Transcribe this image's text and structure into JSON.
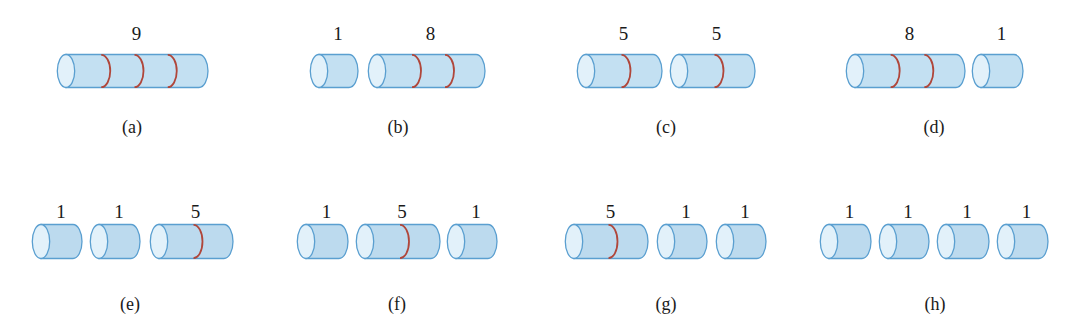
{
  "figure": {
    "colors": {
      "body_fill": "#c3e0f2",
      "body_fill_row2": "#bcdaee",
      "end_cap_fill": "#e2f1fa",
      "outline": "#5a9fd0",
      "cut_line": "#b0463a",
      "text": "#1a1a1a"
    },
    "panels": [
      {
        "id": "a",
        "caption": "(a)",
        "caption_x": 132,
        "row": 1,
        "cylinders": [
          {
            "label": "9",
            "x": 57,
            "w": 151,
            "cuts": 3
          }
        ]
      },
      {
        "id": "b",
        "caption": "(b)",
        "caption_x": 398,
        "row": 1,
        "cylinders": [
          {
            "label": "1",
            "x": 310,
            "w": 48,
            "cuts": 0
          },
          {
            "label": "8",
            "x": 368,
            "w": 117,
            "cuts": 2
          }
        ]
      },
      {
        "id": "c",
        "caption": "(c)",
        "caption_x": 666,
        "row": 1,
        "cylinders": [
          {
            "label": "5",
            "x": 577,
            "w": 85,
            "cuts": 1
          },
          {
            "label": "5",
            "x": 670,
            "w": 85,
            "cuts": 1
          }
        ]
      },
      {
        "id": "d",
        "caption": "(d)",
        "caption_x": 934,
        "row": 1,
        "cylinders": [
          {
            "label": "8",
            "x": 846,
            "w": 119,
            "cuts": 2
          },
          {
            "label": "1",
            "x": 972,
            "w": 51,
            "cuts": 0
          }
        ]
      },
      {
        "id": "e",
        "caption": "(e)",
        "caption_x": 130,
        "row": 2,
        "cylinders": [
          {
            "label": "1",
            "x": 32,
            "w": 50,
            "cuts": 0
          },
          {
            "label": "1",
            "x": 90,
            "w": 50,
            "cuts": 0
          },
          {
            "label": "5",
            "x": 150,
            "w": 83,
            "cuts": 1
          }
        ]
      },
      {
        "id": "f",
        "caption": "(f)",
        "caption_x": 397,
        "row": 2,
        "cylinders": [
          {
            "label": "1",
            "x": 297,
            "w": 51,
            "cuts": 0
          },
          {
            "label": "5",
            "x": 356,
            "w": 84,
            "cuts": 1
          },
          {
            "label": "1",
            "x": 447,
            "w": 50,
            "cuts": 0
          }
        ]
      },
      {
        "id": "g",
        "caption": "(g)",
        "caption_x": 666,
        "row": 2,
        "cylinders": [
          {
            "label": "5",
            "x": 565,
            "w": 83,
            "cuts": 1
          },
          {
            "label": "1",
            "x": 657,
            "w": 50,
            "cuts": 0
          },
          {
            "label": "1",
            "x": 716,
            "w": 50,
            "cuts": 0
          }
        ]
      },
      {
        "id": "h",
        "caption": "(h)",
        "caption_x": 935,
        "row": 2,
        "cylinders": [
          {
            "label": "1",
            "x": 820,
            "w": 51,
            "cuts": 0
          },
          {
            "label": "1",
            "x": 879,
            "w": 50,
            "cuts": 0
          },
          {
            "label": "1",
            "x": 937,
            "w": 52,
            "cuts": 0
          },
          {
            "label": "1",
            "x": 997,
            "w": 51,
            "cuts": 0
          }
        ]
      }
    ],
    "rows": {
      "1": {
        "label_y": 24,
        "cyl_top": 54,
        "cyl_h": 34,
        "caption_y": 118
      },
      "2": {
        "label_y": 202,
        "cyl_top": 224,
        "cyl_h": 35,
        "caption_y": 295
      }
    }
  }
}
